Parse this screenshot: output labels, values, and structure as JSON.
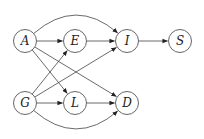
{
  "diagram": {
    "type": "directed-graph",
    "nodes": [
      {
        "id": "A",
        "label": "A"
      },
      {
        "id": "E",
        "label": "E"
      },
      {
        "id": "I",
        "label": "I"
      },
      {
        "id": "S",
        "label": "S"
      },
      {
        "id": "G",
        "label": "G"
      },
      {
        "id": "L",
        "label": "L"
      },
      {
        "id": "D",
        "label": "D"
      }
    ],
    "edges": [
      {
        "from": "A",
        "to": "E"
      },
      {
        "from": "A",
        "to": "I",
        "style": "curved-above"
      },
      {
        "from": "A",
        "to": "L"
      },
      {
        "from": "A",
        "to": "D"
      },
      {
        "from": "E",
        "to": "I"
      },
      {
        "from": "I",
        "to": "S"
      },
      {
        "from": "G",
        "to": "E"
      },
      {
        "from": "G",
        "to": "I"
      },
      {
        "from": "G",
        "to": "L"
      },
      {
        "from": "G",
        "to": "D",
        "style": "curved-below"
      },
      {
        "from": "L",
        "to": "D"
      }
    ],
    "colors": {
      "stroke": "#444444",
      "fill": "#ffffff",
      "text": "#222222"
    }
  }
}
